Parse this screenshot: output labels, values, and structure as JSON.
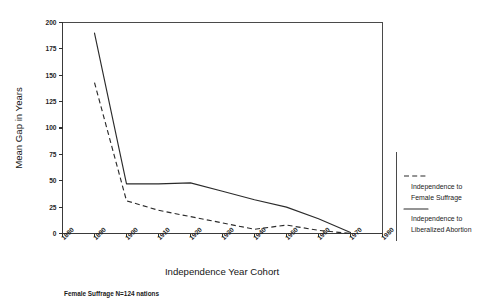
{
  "chart_data": {
    "type": "line",
    "title": "",
    "xlabel": "Independence Year Cohort",
    "ylabel": "Mean Gap in Years",
    "categories": [
      "1880",
      "1890",
      "1900",
      "1910",
      "1920",
      "1930",
      "1940",
      "1950",
      "1960",
      "1970",
      "1980"
    ],
    "x_tick_labels": [
      "1880",
      "1890",
      "1900",
      "1910",
      "1920",
      "1930",
      "1940",
      "1950",
      "1960",
      "1970",
      "1980"
    ],
    "y_tick_labels": [
      "0",
      "25",
      "50",
      "75",
      "100",
      "125",
      "150",
      "175",
      "200"
    ],
    "y_ticks": [
      0,
      25,
      50,
      75,
      100,
      125,
      150,
      175,
      200
    ],
    "ylim": [
      0,
      200
    ],
    "xlim": [
      "1880",
      "1980"
    ],
    "grid": false,
    "legend_position": "right",
    "series": [
      {
        "name": "Independence to Female Suffrage",
        "style": "dashed",
        "x": [
          "1890",
          "1900",
          "1910",
          "1920",
          "1930",
          "1940",
          "1950",
          "1960",
          "1970"
        ],
        "values": [
          143,
          31,
          22,
          16,
          10,
          4,
          8,
          3,
          0
        ]
      },
      {
        "name": "Independence to Liberalized Abortion",
        "style": "solid",
        "x": [
          "1890",
          "1900",
          "1910",
          "1920",
          "1930",
          "1940",
          "1950",
          "1960",
          "1970"
        ],
        "values": [
          190,
          47,
          47,
          48,
          40,
          32,
          25,
          14,
          1
        ]
      }
    ],
    "footnote": "Female Suffrage N=124 nations"
  },
  "axes": {
    "x_title": "Independence Year Cohort",
    "y_title": "Mean Gap in Years"
  },
  "legend": {
    "entries": [
      {
        "line1": "Independence to",
        "line2": "Female Suffrage",
        "style": "dashed"
      },
      {
        "line1": "Independence to",
        "line2": "Liberalized Abortion",
        "style": "solid"
      }
    ]
  },
  "footnote": {
    "text": "Female Suffrage N=124 nations"
  },
  "colors": {
    "line": "#2b2b2b",
    "axis": "#3a3a3a",
    "text": "#1a1a1a",
    "background": "#ffffff"
  }
}
